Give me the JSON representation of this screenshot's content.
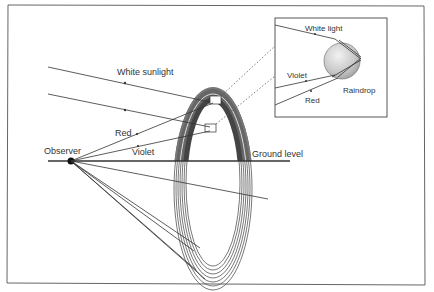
{
  "diagram": {
    "type": "rainbow-formation",
    "labels": {
      "white_sunlight": "White sunlight",
      "red": "Red",
      "violet": "Violet",
      "observer": "Observer",
      "ground_level": "Ground level"
    },
    "inset": {
      "white_light": "White light",
      "violet": "Violet",
      "red": "Red",
      "raindrop": "Raindrop"
    },
    "colors": {
      "line": "#333333",
      "frame": "#555555",
      "band_dark": "#555555",
      "band_mid": "#888888",
      "raindrop_fill": "#cfcfcf",
      "observer_dot": "#111111"
    }
  }
}
